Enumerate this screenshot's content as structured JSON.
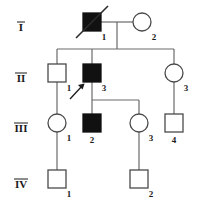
{
  "figure": {
    "kind": "pedigree-chart",
    "width": 203,
    "height": 208,
    "background_color": "#ffffff",
    "line_color": "#6a6a6a",
    "affected_fill_color": "#111111",
    "unaffected_fill_color": "#ffffff",
    "symbol_stroke_color": "#4a4a4a",
    "label_color": "#1a1a1a"
  },
  "legend_semantics": {
    "square": "male",
    "circle": "female",
    "filled": "affected",
    "open": "unaffected",
    "diagonal_slash": "deceased",
    "arrow": "proband"
  },
  "generations": [
    {
      "label": "I",
      "y": 31
    },
    {
      "label": "II",
      "y": 82
    },
    {
      "label": "III",
      "y": 132
    },
    {
      "label": "IV",
      "y": 188
    }
  ],
  "individuals": [
    {
      "id": "I-1",
      "generation": "I",
      "number": "1",
      "sex": "male",
      "shape": "square",
      "affected": true,
      "deceased": true,
      "proband": false,
      "cx": 92,
      "cy": 22
    },
    {
      "id": "I-2",
      "generation": "I",
      "number": "2",
      "sex": "female",
      "shape": "circle",
      "affected": false,
      "deceased": false,
      "proband": false,
      "cx": 142,
      "cy": 22
    },
    {
      "id": "II-1",
      "generation": "II",
      "number": "1",
      "sex": "male",
      "shape": "square",
      "affected": false,
      "deceased": false,
      "proband": false,
      "cx": 57,
      "cy": 73
    },
    {
      "id": "II-2",
      "generation": "II",
      "number": "2",
      "sex": "male",
      "shape": "square",
      "affected": true,
      "deceased": false,
      "proband": true,
      "cx": 92,
      "cy": 73
    },
    {
      "id": "II-3",
      "generation": "II",
      "number": "3",
      "sex": "female",
      "shape": "circle",
      "affected": false,
      "deceased": false,
      "proband": false,
      "cx": 174,
      "cy": 73
    },
    {
      "id": "III-1",
      "generation": "III",
      "number": "1",
      "sex": "female",
      "shape": "circle",
      "affected": false,
      "deceased": false,
      "proband": false,
      "cx": 57,
      "cy": 123
    },
    {
      "id": "III-2",
      "generation": "III",
      "number": "2",
      "sex": "male",
      "shape": "square",
      "affected": true,
      "deceased": false,
      "proband": false,
      "cx": 92,
      "cy": 123
    },
    {
      "id": "III-3",
      "generation": "III",
      "number": "3",
      "sex": "female",
      "shape": "circle",
      "affected": false,
      "deceased": false,
      "proband": false,
      "cx": 139,
      "cy": 123
    },
    {
      "id": "III-4",
      "generation": "III",
      "number": "4",
      "sex": "male",
      "shape": "square",
      "affected": false,
      "deceased": false,
      "proband": false,
      "cx": 174,
      "cy": 123
    },
    {
      "id": "IV-1",
      "generation": "IV",
      "number": "1",
      "sex": "male",
      "shape": "square",
      "affected": false,
      "deceased": false,
      "proband": false,
      "cx": 57,
      "cy": 179
    },
    {
      "id": "IV-2",
      "generation": "IV",
      "number": "2",
      "sex": "male",
      "shape": "square",
      "affected": false,
      "deceased": false,
      "proband": false,
      "cx": 139,
      "cy": 179
    }
  ],
  "matings": [
    {
      "partners": [
        "I-1",
        "I-2"
      ],
      "children": [
        "II-1",
        "II-2",
        "II-3"
      ]
    },
    {
      "partners": [
        "II-2"
      ],
      "children": [
        "III-2",
        "III-3"
      ]
    },
    {
      "partners": [
        "II-1"
      ],
      "children": [
        "III-1"
      ]
    },
    {
      "partners": [
        "II-3"
      ],
      "children": [
        "III-4"
      ]
    },
    {
      "partners": [
        "III-1"
      ],
      "children": [
        "IV-1"
      ]
    },
    {
      "partners": [
        "III-3"
      ],
      "children": [
        "IV-2"
      ]
    }
  ]
}
